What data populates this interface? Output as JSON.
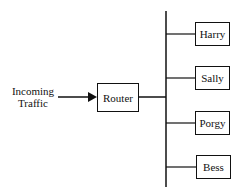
{
  "diagram": {
    "source_label_line1": "Incoming",
    "source_label_line2": "Traffic",
    "router": "Router",
    "nodes": [
      "Harry",
      "Sally",
      "Porgy",
      "Bess"
    ]
  }
}
